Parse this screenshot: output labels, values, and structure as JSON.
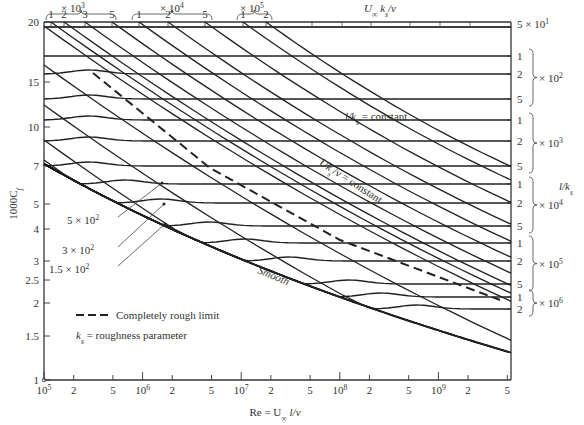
{
  "chart_data": {
    "type": "line",
    "title": "",
    "xlabel": "Re = U∞ l/ν",
    "ylabel": "1000C_f",
    "xscale": "log",
    "yscale": "log",
    "xlim": [
      100000,
      5000000000
    ],
    "ylim": [
      1,
      20
    ],
    "x_ticks": [
      {
        "label": "10^5",
        "value": 100000
      },
      {
        "label": "2",
        "value": 200000
      },
      {
        "label": "5",
        "value": 500000
      },
      {
        "label": "10^6",
        "value": 1000000
      },
      {
        "label": "2",
        "value": 2000000
      },
      {
        "label": "5",
        "value": 5000000
      },
      {
        "label": "10^7",
        "value": 10000000
      },
      {
        "label": "2",
        "value": 20000000
      },
      {
        "label": "5",
        "value": 50000000
      },
      {
        "label": "10^8",
        "value": 100000000
      },
      {
        "label": "2",
        "value": 200000000
      },
      {
        "label": "5",
        "value": 500000000
      },
      {
        "label": "10^9",
        "value": 1000000000
      },
      {
        "label": "2",
        "value": 2000000000
      },
      {
        "label": "5",
        "value": 5000000000
      }
    ],
    "y_ticks": [
      "1",
      "1.5",
      "2",
      "2.5",
      "3",
      "4",
      "5",
      "7",
      "10",
      "15",
      "20"
    ],
    "top_axis": {
      "label": "U∞ k_s/ν",
      "groups": [
        {
          "multiplier": "× 10^3",
          "ticks": [
            "1",
            "2",
            "3",
            "5"
          ]
        },
        {
          "multiplier": "× 10^4",
          "ticks": [
            "1",
            "2",
            "5"
          ]
        },
        {
          "multiplier": "× 10^5",
          "ticks": [
            "1",
            "2"
          ]
        }
      ]
    },
    "right_axis": {
      "label": "l/k_s",
      "top_value": "5 × 10^1",
      "groups": [
        {
          "multiplier": "× 10^2",
          "ticks": [
            "1",
            "2",
            "5"
          ]
        },
        {
          "multiplier": "× 10^3",
          "ticks": [
            "1",
            "2",
            "5"
          ]
        },
        {
          "multiplier": "× 10^4",
          "ticks": [
            "1",
            "2",
            "5"
          ]
        },
        {
          "multiplier": "× 10^5",
          "ticks": [
            "1",
            "2",
            "5"
          ]
        },
        {
          "multiplier": "× 10^6",
          "ticks": [
            "1",
            "2"
          ]
        }
      ]
    },
    "series": [
      {
        "name": "Smooth",
        "style": "solid",
        "x": [
          100000,
          1000000,
          10000000,
          100000000,
          1000000000,
          5000000000
        ],
        "y": [
          7.2,
          4.4,
          2.95,
          2.1,
          1.55,
          1.35
        ]
      },
      {
        "name": "Completely rough limit",
        "style": "dashed",
        "x": [
          300000,
          1000000,
          10000000,
          100000000,
          1000000000,
          5000000000
        ],
        "y": [
          12.6,
          8.3,
          4.6,
          3.0,
          2.2,
          1.85
        ]
      },
      {
        "name": "l/k_s = constant (5×10^1 … 2×10^6)",
        "style": "solid",
        "note": "near-horizontal lines, one per l/k_s value",
        "l_over_ks": [
          50,
          100,
          200,
          500,
          1000,
          2000,
          5000,
          10000,
          20000,
          50000,
          100000,
          200000,
          500000,
          1000000,
          2000000
        ],
        "cf_x1000_asymptote": [
          19.5,
          16.3,
          13.6,
          11.0,
          9.4,
          8.1,
          6.7,
          5.9,
          5.15,
          4.4,
          3.95,
          3.5,
          3.0,
          2.75,
          2.5
        ]
      },
      {
        "name": "U k_s/ν = constant",
        "style": "solid",
        "note": "diagonal lines",
        "values": [
          150,
          300,
          500,
          1000,
          2000,
          3000,
          5000,
          10000,
          20000,
          50000,
          100000,
          200000
        ]
      }
    ],
    "annotations": [
      "l/k_s = constant",
      "U k_s/ν = constant",
      "Smooth",
      "5 × 10^2",
      "3 × 10^2",
      "1.5 × 10^2",
      "Completely rough limit",
      "k_s = roughness parameter"
    ],
    "grid": false,
    "legend_position": "lower-left"
  },
  "labels": {
    "ylabel_main": "1000C",
    "ylabel_sub": "f",
    "xlabel": "Re = U",
    "xlabel_inf": "∞",
    "xlabel_rest": " l/ν",
    "toplabel": "U",
    "toplabel_inf": "∞",
    "toplabel_rest": " k",
    "toplabel_s": "s",
    "toplabel_end": "/ν",
    "rightlabel": "l/k",
    "rightlabel_s": "s",
    "lks_const": " = constant",
    "lks_const_pre": "l/k",
    "uks_const": "Uk",
    "uks_const_rest": "/ν = constant",
    "smooth": "Smooth",
    "a500": "5 × 10",
    "a300": "3 × 10",
    "a150": "1.5 × 10",
    "exp2": "2",
    "legend_dash": "Completely rough limit",
    "legend_ks": " = roughness parameter",
    "legend_ks_k": "k",
    "legend_ks_s": "s"
  }
}
